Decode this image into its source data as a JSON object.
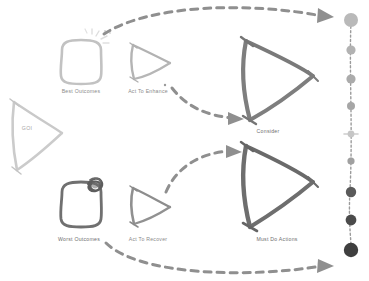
{
  "diagram": {
    "background": "#ffffff",
    "palette": {
      "very_light": "#cfcfcf",
      "light": "#bdbdbd",
      "mid_light": "#a8a8a8",
      "mid": "#949494",
      "mid_dark": "#7d7d7d",
      "dark": "#606060",
      "darker": "#4a4a4a",
      "darkest": "#3b3b3b",
      "arrow": "#8f8f8f",
      "label": "#8c8c8c"
    },
    "nodes": [
      {
        "id": "goi",
        "label": "GOI",
        "shape": "triangle",
        "size": "medium",
        "tone": "very_light",
        "label_inside": true,
        "x": 38,
        "y": 132,
        "label_x": 23,
        "label_y": 130
      },
      {
        "id": "best-outcomes",
        "label": "Best Outcomes",
        "shape": "rounded-square",
        "size": "small",
        "tone": "light",
        "decoration": "sparkle-burst",
        "x": 81,
        "y": 62,
        "label_x": 81,
        "label_y": 91
      },
      {
        "id": "act-to-enhance",
        "label": "Act To Enhance",
        "shape": "triangle",
        "size": "small",
        "tone": "mid_light",
        "x": 148,
        "y": 62,
        "label_x": 148,
        "label_y": 91
      },
      {
        "id": "consider",
        "label": "Consider",
        "shape": "triangle",
        "size": "large",
        "tone": "mid_dark",
        "x": 272,
        "y": 78,
        "label_x": 268,
        "label_y": 131
      },
      {
        "id": "worst-outcomes",
        "label": "Worst Outcomes",
        "shape": "rounded-square",
        "size": "small",
        "tone": "mid_dark",
        "decoration": "dark-scribble",
        "x": 81,
        "y": 204,
        "label_x": 79,
        "label_y": 239
      },
      {
        "id": "act-to-recover",
        "label": "Act To Recover",
        "shape": "triangle",
        "size": "small",
        "tone": "mid",
        "x": 148,
        "y": 205,
        "label_x": 148,
        "label_y": 239
      },
      {
        "id": "must-do-actions",
        "label": "Must Do Actions",
        "shape": "triangle",
        "size": "large",
        "tone": "dark",
        "x": 272,
        "y": 184,
        "label_x": 276,
        "label_y": 239
      }
    ],
    "connectors": [
      {
        "id": "best-to-top",
        "from": "best-outcomes",
        "to": "scale-top",
        "style": "dashed-curve",
        "arrowhead": true
      },
      {
        "id": "enhance-to-consider",
        "from": "act-to-enhance",
        "to": "consider",
        "style": "dashed-curve",
        "arrowhead": true
      },
      {
        "id": "recover-to-mustdo",
        "from": "act-to-recover",
        "to": "must-do-actions",
        "style": "dashed-curve",
        "arrowhead": true
      },
      {
        "id": "worst-to-bottom",
        "from": "worst-outcomes",
        "to": "scale-bottom",
        "style": "dashed-curve",
        "arrowhead": true
      }
    ],
    "scale": {
      "id": "severity-scale",
      "orientation": "vertical",
      "x": 351,
      "dots": [
        {
          "index": 0,
          "y": 20,
          "r": 7.0,
          "color": "#b9b9b9"
        },
        {
          "index": 1,
          "y": 50,
          "r": 4.6,
          "color": "#b2b2b2"
        },
        {
          "index": 2,
          "y": 79,
          "r": 4.6,
          "color": "#ababab"
        },
        {
          "index": 3,
          "y": 106,
          "r": 4.0,
          "color": "#a6a6a6"
        },
        {
          "index": 4,
          "y": 134,
          "r": 3.4,
          "color": "#c6c6c6"
        },
        {
          "index": 5,
          "y": 161,
          "r": 3.6,
          "color": "#a0a0a0"
        },
        {
          "index": 6,
          "y": 192,
          "r": 5.2,
          "color": "#5a5a5a"
        },
        {
          "index": 7,
          "y": 220,
          "r": 5.4,
          "color": "#4b4b4b"
        },
        {
          "index": 8,
          "y": 250,
          "r": 7.2,
          "color": "#3f3f3f"
        }
      ]
    }
  }
}
